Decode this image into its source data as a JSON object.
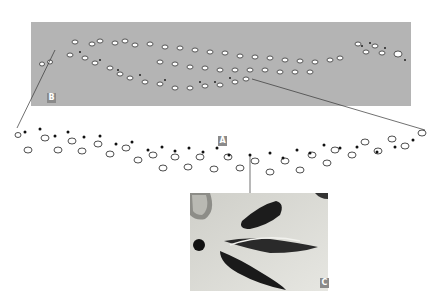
{
  "figure": {
    "labels": {
      "a": "A",
      "b": "B",
      "c": "C"
    },
    "panels": [
      {
        "id": "B",
        "description": "Gray field overview of footprint trackways"
      },
      {
        "id": "A",
        "description": "Line drawing of individual footprint trail (detail)"
      },
      {
        "id": "C",
        "description": "Photograph of a single three-toed footprint"
      }
    ],
    "colors": {
      "panel_gray": "#b4b4b4",
      "label_bg": "#8a8a8a",
      "ink": "#222222",
      "connector": "#333333"
    }
  }
}
